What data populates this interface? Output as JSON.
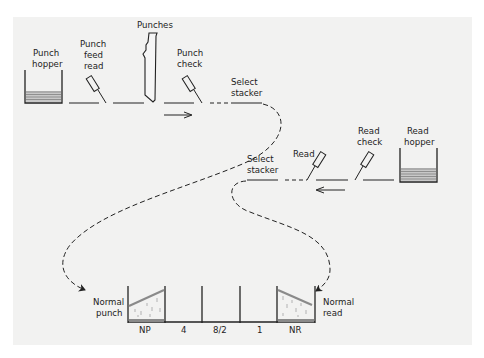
{
  "diagram": {
    "title": "",
    "colors": {
      "background": "#ffffff",
      "panel": "#f2f2f1",
      "ink": "#222222",
      "card": "#888888"
    },
    "top_row": {
      "direction_arrow": "right",
      "stations": [
        {
          "id": "punch-hopper",
          "label_lines": [
            "Punch",
            "hopper"
          ]
        },
        {
          "id": "punch-feed-read",
          "label_lines": [
            "Punch",
            "feed",
            "read"
          ]
        },
        {
          "id": "punches",
          "label_lines": [
            "Punches"
          ]
        },
        {
          "id": "punch-check",
          "label_lines": [
            "Punch",
            "check"
          ]
        },
        {
          "id": "select-stacker-punch",
          "label_lines": [
            "Select",
            "stacker"
          ]
        }
      ]
    },
    "bottom_row": {
      "direction_arrow": "left",
      "stations": [
        {
          "id": "select-stacker-read",
          "label_lines": [
            "Select",
            "stacker"
          ]
        },
        {
          "id": "read",
          "label_lines": [
            "Read"
          ]
        },
        {
          "id": "read-check",
          "label_lines": [
            "Read",
            "check"
          ]
        },
        {
          "id": "read-hopper",
          "label_lines": [
            "Read",
            "hopper"
          ]
        }
      ]
    },
    "stackers": {
      "left_label_lines": [
        "Normal",
        "punch"
      ],
      "right_label_lines": [
        "Normal",
        "read"
      ],
      "pockets": [
        "NP",
        "4",
        "8/2",
        "1",
        "NR"
      ]
    }
  }
}
